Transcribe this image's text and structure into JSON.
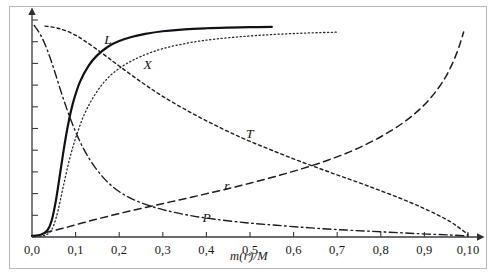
{
  "chart_data": {
    "type": "line",
    "title": "",
    "subtitle": "",
    "xlabel": "m(r)/M",
    "ylabel": "",
    "xlim": [
      0.0,
      1.0
    ],
    "ylim": [
      0.0,
      1.0
    ],
    "grid": false,
    "legend_position": "inline-labels",
    "xticks": [
      0.0,
      0.1,
      0.2,
      0.3,
      0.4,
      0.5,
      0.6,
      0.7,
      0.8,
      0.9,
      1.0
    ],
    "xticklabels": [
      "0,0",
      "0,1",
      "0,2",
      "0,3",
      "0,4",
      "0,5",
      "0,6",
      "0,7",
      "0,8",
      "0,9",
      "0,10"
    ],
    "yticks": [
      0.0,
      0.1,
      0.2,
      0.3,
      0.4,
      0.5,
      0.6,
      0.7,
      0.8,
      0.9,
      1.0
    ],
    "yticklabels": [
      "",
      "",
      "",
      "",
      "",
      "",
      "",
      "",
      "",
      "",
      ""
    ],
    "axis_style": "arrows",
    "series": [
      {
        "name": "L",
        "label": "L",
        "linestyle": "solid",
        "color": "#111116",
        "linewidth": 2.2,
        "x": [
          0.0,
          0.02,
          0.035,
          0.045,
          0.055,
          0.065,
          0.075,
          0.085,
          0.095,
          0.11,
          0.13,
          0.15,
          0.175,
          0.2,
          0.23,
          0.26,
          0.3,
          0.35,
          0.4,
          0.45,
          0.5,
          0.55
        ],
        "y": [
          0.005,
          0.01,
          0.03,
          0.075,
          0.17,
          0.3,
          0.43,
          0.54,
          0.625,
          0.715,
          0.79,
          0.838,
          0.878,
          0.903,
          0.923,
          0.936,
          0.948,
          0.957,
          0.962,
          0.965,
          0.967,
          0.968
        ]
      },
      {
        "name": "X",
        "label": "X",
        "linestyle": "dotted",
        "color": "#2a2a30",
        "linewidth": 1.3,
        "x": [
          0.0,
          0.025,
          0.04,
          0.05,
          0.06,
          0.072,
          0.085,
          0.1,
          0.12,
          0.145,
          0.175,
          0.21,
          0.25,
          0.3,
          0.36,
          0.42,
          0.49,
          0.56,
          0.63,
          0.7
        ],
        "y": [
          0.002,
          0.006,
          0.02,
          0.055,
          0.125,
          0.235,
          0.35,
          0.455,
          0.565,
          0.658,
          0.735,
          0.79,
          0.832,
          0.868,
          0.895,
          0.912,
          0.925,
          0.934,
          0.94,
          0.944
        ]
      },
      {
        "name": "T",
        "label": "T",
        "linestyle": "dashed-short",
        "color": "#1d1d22",
        "linewidth": 1.4,
        "x": [
          0.03,
          0.06,
          0.09,
          0.12,
          0.16,
          0.2,
          0.25,
          0.3,
          0.36,
          0.42,
          0.48,
          0.54,
          0.6,
          0.66,
          0.72,
          0.78,
          0.84,
          0.89,
          0.93,
          0.96,
          0.98,
          1.0
        ],
        "y": [
          0.972,
          0.962,
          0.94,
          0.905,
          0.848,
          0.788,
          0.715,
          0.648,
          0.578,
          0.515,
          0.458,
          0.408,
          0.36,
          0.315,
          0.272,
          0.228,
          0.182,
          0.14,
          0.102,
          0.07,
          0.042,
          0.012
        ]
      },
      {
        "name": "r",
        "label": "r",
        "linestyle": "dashed-long",
        "color": "#1d1d22",
        "linewidth": 1.5,
        "x": [
          0.03,
          0.08,
          0.14,
          0.2,
          0.26,
          0.32,
          0.38,
          0.44,
          0.5,
          0.56,
          0.62,
          0.68,
          0.74,
          0.8,
          0.85,
          0.89,
          0.92,
          0.945,
          0.962,
          0.975,
          0.984,
          0.99
        ],
        "y": [
          0.02,
          0.045,
          0.078,
          0.108,
          0.136,
          0.163,
          0.19,
          0.218,
          0.248,
          0.28,
          0.315,
          0.355,
          0.402,
          0.462,
          0.525,
          0.59,
          0.655,
          0.725,
          0.79,
          0.852,
          0.905,
          0.945
        ]
      },
      {
        "name": "P",
        "label": "P",
        "linestyle": "dashdot",
        "color": "#1d1d22",
        "linewidth": 1.4,
        "x": [
          0.005,
          0.02,
          0.035,
          0.05,
          0.065,
          0.082,
          0.1,
          0.12,
          0.145,
          0.175,
          0.21,
          0.25,
          0.3,
          0.36,
          0.42,
          0.49,
          0.56,
          0.64,
          0.72,
          0.8,
          0.88,
          0.96,
          1.0
        ],
        "y": [
          0.975,
          0.93,
          0.862,
          0.775,
          0.68,
          0.578,
          0.485,
          0.4,
          0.32,
          0.25,
          0.196,
          0.158,
          0.126,
          0.1,
          0.082,
          0.066,
          0.054,
          0.042,
          0.032,
          0.024,
          0.016,
          0.009,
          0.005
        ]
      }
    ],
    "annotations": [
      {
        "text": "L",
        "x": 0.175,
        "y": 0.905
      },
      {
        "text": "X",
        "x": 0.265,
        "y": 0.79
      },
      {
        "text": "T",
        "x": 0.5,
        "y": 0.47
      },
      {
        "text": "r",
        "x": 0.45,
        "y": 0.23
      },
      {
        "text": "P",
        "x": 0.4,
        "y": 0.085
      }
    ]
  },
  "figure": {
    "frame_border_color": "#b9b9b9",
    "background": "#ffffff",
    "axis_color": "#3a3a40"
  }
}
